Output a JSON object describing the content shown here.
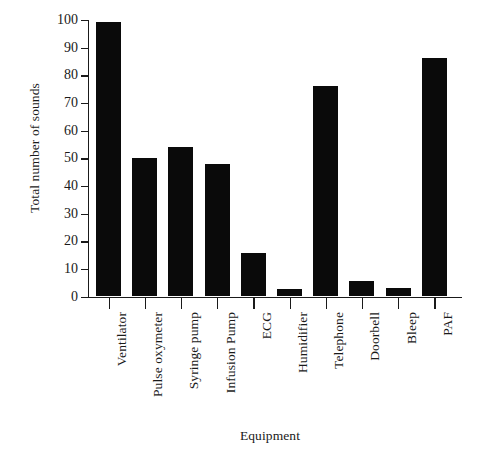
{
  "chart_data": {
    "type": "bar",
    "title": "",
    "xlabel": "Equipment",
    "ylabel": "Total number of sounds",
    "categories": [
      "Ventilator",
      "Pulse oxymeter",
      "Syringe pump",
      "Infusion Pump",
      "ECG",
      "Humidifier",
      "Telephone",
      "Doorbell",
      "Bleep",
      "PAF"
    ],
    "values": [
      99,
      50,
      54,
      48,
      15.5,
      2.5,
      76,
      5.5,
      3,
      86
    ],
    "ylim": [
      0,
      100
    ],
    "yticks": [
      0,
      10,
      20,
      30,
      40,
      50,
      60,
      70,
      80,
      90,
      100
    ],
    "ytick_labels": [
      "0",
      "10",
      "20",
      "30",
      "40",
      "50",
      "60",
      "70",
      "80",
      "90",
      "100"
    ],
    "grid": false,
    "legend": false,
    "bar_color": "#0a0a0a",
    "axis_color": "#1a1a1a",
    "background": "#ffffff"
  }
}
